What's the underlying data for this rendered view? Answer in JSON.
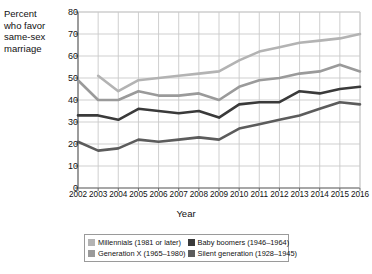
{
  "chart_data": {
    "type": "line",
    "title": "",
    "xlabel": "Year",
    "ylabel": "Percent who favor same-sex marriage",
    "ylabel_lines": [
      "Percent",
      "who favor",
      "same-sex",
      "marriage"
    ],
    "x": [
      2002,
      2003,
      2004,
      2005,
      2006,
      2007,
      2008,
      2009,
      2010,
      2011,
      2012,
      2013,
      2014,
      2015,
      2016
    ],
    "categories": [
      "2002",
      "2003",
      "2004",
      "2005",
      "2006",
      "2007",
      "2008",
      "2009",
      "2010",
      "2011",
      "2012",
      "2013",
      "2014",
      "2015",
      "2016"
    ],
    "xlim": [
      2002,
      2016
    ],
    "ylim": [
      0,
      80
    ],
    "yticks": [
      0,
      10,
      20,
      30,
      40,
      50,
      60,
      70,
      80
    ],
    "grid": true,
    "legend_position": "bottom",
    "series": [
      {
        "name": "Millennials (1981 or later)",
        "color": "#b3b3b3",
        "values": [
          null,
          51,
          44,
          49,
          50,
          51,
          52,
          53,
          58,
          62,
          64,
          66,
          67,
          68,
          70
        ]
      },
      {
        "name": "Generation X (1965–1980)",
        "color": "#9a9a9a",
        "values": [
          49,
          40,
          40,
          44,
          42,
          42,
          43,
          40,
          46,
          49,
          50,
          52,
          53,
          56,
          53
        ]
      },
      {
        "name": "Baby boomers (1946–1964)",
        "color": "#3a3a3a",
        "values": [
          33,
          33,
          31,
          36,
          35,
          34,
          35,
          32,
          38,
          39,
          39,
          44,
          43,
          45,
          46
        ]
      },
      {
        "name": "Silent generation (1928–1945)",
        "color": "#5c5c5c",
        "values": [
          21,
          17,
          18,
          22,
          21,
          22,
          23,
          22,
          27,
          29,
          31,
          33,
          36,
          39,
          38
        ]
      }
    ]
  },
  "legend": {
    "items": [
      {
        "label": "Millennials (1981 or later)",
        "color": "#b3b3b3",
        "swatch": "legend-swatch-millennials"
      },
      {
        "label": "Baby boomers (1946–1964)",
        "color": "#3a3a3a",
        "swatch": "legend-swatch-baby-boomers"
      },
      {
        "label": "Generation X (1965–1980)",
        "color": "#9a9a9a",
        "swatch": "legend-swatch-generation-x"
      },
      {
        "label": "Silent generation (1928–1945)",
        "color": "#5c5c5c",
        "swatch": "legend-swatch-silent-generation"
      }
    ]
  },
  "axes": {
    "y_title_lines": [
      "Percent",
      "who favor",
      "same-sex",
      "marriage"
    ],
    "x_title": "Year",
    "y_ticks": [
      "0",
      "10",
      "20",
      "30",
      "40",
      "50",
      "60",
      "70",
      "80"
    ],
    "x_ticks": [
      "2002",
      "2003",
      "2004",
      "2005",
      "2006",
      "2007",
      "2008",
      "2009",
      "2010",
      "2011",
      "2012",
      "2013",
      "2014",
      "2015",
      "2016"
    ]
  },
  "colors": {
    "grid": "#c9c9c9",
    "axis": "#6b6b6b",
    "background": "#ffffff",
    "text": "#111111"
  }
}
